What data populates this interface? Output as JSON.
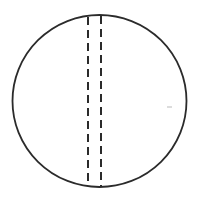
{
  "figure": {
    "title": "Circle with two vertical dashed lines",
    "type": "line-drawing",
    "background_color": "#ffffff",
    "canvas": {
      "width": 201,
      "height": 204
    },
    "shapes": {
      "circle": {
        "name": "outer-circle",
        "center_x": 99.5,
        "center_y": 101,
        "radius_x": 87,
        "radius_y": 86,
        "stroke_color": "#2b2b2b",
        "stroke_width": 1.8,
        "fill": "none"
      },
      "dashed_lines": [
        {
          "name": "left-dashed-line",
          "x": 88,
          "y_start": 17,
          "y_end": 186,
          "stroke_color": "#2b2b2b",
          "stroke_width": 2,
          "dash_length": 8,
          "gap_length": 5
        },
        {
          "name": "right-dashed-line",
          "x": 101,
          "y_start": 16,
          "y_end": 187,
          "stroke_color": "#2b2b2b",
          "stroke_width": 2,
          "dash_length": 8,
          "gap_length": 5
        }
      ],
      "speck": {
        "name": "faint-speck-mark",
        "x": 167,
        "y": 106,
        "width": 5,
        "height": 2,
        "color": "#dcdcdc"
      }
    }
  }
}
